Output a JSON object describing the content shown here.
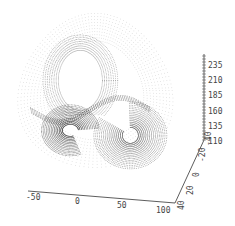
{
  "chart_data": {
    "type": "scatter",
    "subtype": "3d-point-cloud",
    "title": "",
    "x_axis": {
      "label": "",
      "ticks": [
        "-50",
        "0",
        "50",
        "100"
      ],
      "range": [
        -50,
        100
      ]
    },
    "y_axis": {
      "label": "",
      "ticks": [
        "40",
        "20",
        "0",
        "-20",
        "-40"
      ],
      "range": [
        -40,
        40
      ]
    },
    "z_axis": {
      "label": "",
      "ticks": [
        "110",
        "135",
        "160",
        "185",
        "210",
        "235"
      ],
      "range": [
        110,
        235
      ]
    },
    "grid": false,
    "legend": null,
    "point_color": "#222222"
  },
  "axes": {
    "x_ticks": [
      "-50",
      "0",
      "50",
      "100"
    ],
    "y_ticks": [
      "40",
      "20",
      "0",
      "-20",
      "-40"
    ],
    "z_ticks": [
      "110",
      "135",
      "160",
      "185",
      "210",
      "235"
    ]
  }
}
